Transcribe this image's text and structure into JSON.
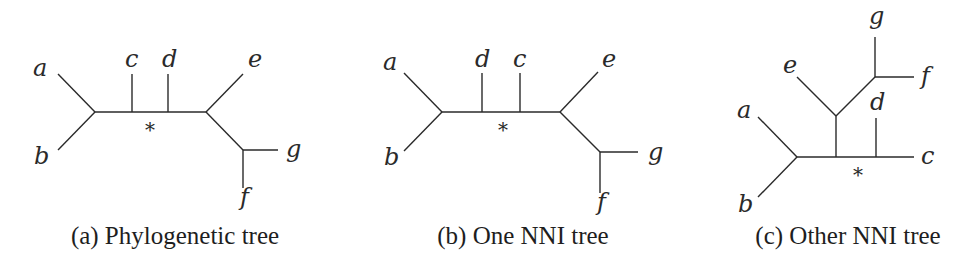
{
  "figure": {
    "panels": [
      {
        "id": "a",
        "caption": "(a) Phylogenetic tree",
        "marker": "*",
        "leaves": {
          "a": "a",
          "b": "b",
          "c": "c",
          "d": "d",
          "e": "e",
          "f": "f",
          "g": "g"
        }
      },
      {
        "id": "b",
        "caption": "(b) One NNI tree",
        "marker": "*",
        "leaves": {
          "a": "a",
          "b": "b",
          "c": "c",
          "d": "d",
          "e": "e",
          "f": "f",
          "g": "g"
        }
      },
      {
        "id": "c",
        "caption": "(c) Other NNI tree",
        "marker": "*",
        "leaves": {
          "a": "a",
          "b": "b",
          "c": "c",
          "d": "d",
          "e": "e",
          "f": "f",
          "g": "g"
        }
      }
    ]
  }
}
